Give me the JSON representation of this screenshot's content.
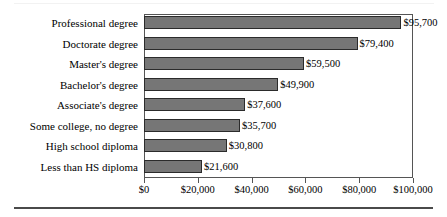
{
  "chart_data": {
    "type": "bar",
    "orientation": "horizontal",
    "title": "",
    "xlabel": "",
    "ylabel": "",
    "grid": false,
    "legend": null,
    "xlim": [
      0,
      100000
    ],
    "xticks": [
      0,
      20000,
      40000,
      60000,
      80000,
      100000
    ],
    "xtick_labels": [
      "$0",
      "$20,000",
      "$40,000",
      "$60,000",
      "$80,000",
      "$100,000"
    ],
    "categories": [
      "Professional degree",
      "Doctorate degree",
      "Master's degree",
      "Bachelor's degree",
      "Associate's degree",
      "Some college, no degree",
      "High school diploma",
      "Less than HS diploma"
    ],
    "values": [
      95700,
      79400,
      59500,
      49900,
      37600,
      35700,
      30800,
      21600
    ],
    "value_labels": [
      "$95,700",
      "$79,400",
      "$59,500",
      "$49,900",
      "$37,600",
      "$35,700",
      "$30,800",
      "$21,600"
    ],
    "colors": {
      "bar_fill": "#767676",
      "bar_border": "#2b2b2b",
      "axis": "#555555",
      "text": "#000000",
      "rule": "#4a4a4a"
    }
  }
}
